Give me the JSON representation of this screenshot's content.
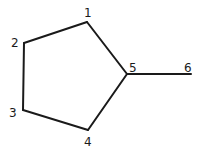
{
  "diagram": {
    "type": "molecular-skeleton",
    "atoms": [
      {
        "id": "1",
        "label": "1",
        "x": 87,
        "y": 22,
        "label_x": 88,
        "label_y": 17
      },
      {
        "id": "2",
        "label": "2",
        "x": 24,
        "y": 43,
        "label_x": 15,
        "label_y": 47
      },
      {
        "id": "3",
        "label": "3",
        "x": 23,
        "y": 110,
        "label_x": 13,
        "label_y": 117
      },
      {
        "id": "4",
        "label": "4",
        "x": 88,
        "y": 130,
        "label_x": 87,
        "label_y": 146
      },
      {
        "id": "5",
        "label": "5",
        "x": 127,
        "y": 74,
        "label_x": 132,
        "label_y": 72
      },
      {
        "id": "6",
        "label": "6",
        "x": 191,
        "y": 74,
        "label_x": 188,
        "label_y": 72
      }
    ],
    "bonds": [
      {
        "from": "1",
        "to": "2"
      },
      {
        "from": "2",
        "to": "3"
      },
      {
        "from": "3",
        "to": "4"
      },
      {
        "from": "4",
        "to": "5"
      },
      {
        "from": "5",
        "to": "1"
      },
      {
        "from": "5",
        "to": "6"
      }
    ]
  }
}
